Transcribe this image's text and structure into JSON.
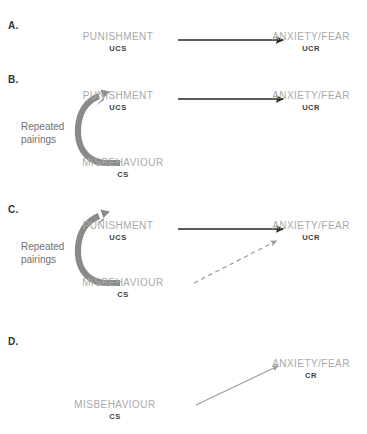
{
  "figure": {
    "title_visible": false,
    "background_color": "#ffffff",
    "node_label_color": "#a9a9a9",
    "node_sub_color": "#3d3d3d",
    "panel_letter_color": "#333333",
    "solid_arrow_color": "#262626",
    "curved_arrow_color": "#8a8a8a",
    "dashed_arrow_color": "#9a9a9a",
    "thin_arrow_color": "#9a9a9a"
  },
  "panels": [
    {
      "letter": "A.",
      "pairings_label": "",
      "nodes": {
        "ucs_label": "PUNISHMENT",
        "ucs_sub": "UCS",
        "ucr_label": "ANXIETY/FEAR",
        "ucr_sub": "UCR",
        "cs_label": "",
        "cs_sub": ""
      }
    },
    {
      "letter": "B.",
      "pairings_label_line1": "Repeated",
      "pairings_label_line2": "pairings",
      "nodes": {
        "ucs_label": "PUNISHMENT",
        "ucs_sub": "UCS",
        "ucr_label": "ANXIETY/FEAR",
        "ucr_sub": "UCR",
        "cs_label": "MISBEHAVIOUR",
        "cs_sub": "CS"
      }
    },
    {
      "letter": "C.",
      "pairings_label_line1": "Repeated",
      "pairings_label_line2": "pairings",
      "nodes": {
        "ucs_label": "PUNISHMENT",
        "ucs_sub": "UCS",
        "ucr_label": "ANXIETY/FEAR",
        "ucr_sub": "UCR",
        "cs_label": "MISBEHAVIOUR",
        "cs_sub": "CS"
      }
    },
    {
      "letter": "D.",
      "pairings_label": "",
      "nodes": {
        "cs_label": "MISBEHAVIOUR",
        "cs_sub": "CS",
        "cr_label": "ANXIETY/FEAR",
        "cr_sub": "CR"
      }
    }
  ]
}
